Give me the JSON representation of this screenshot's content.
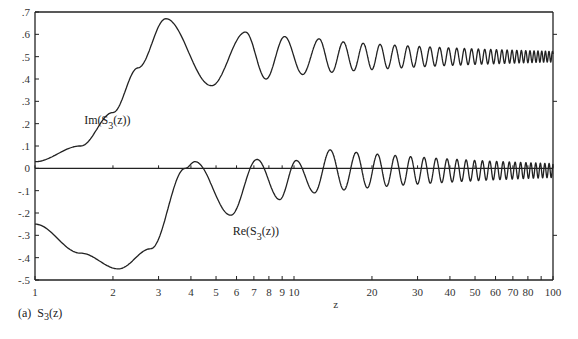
{
  "chart_data": {
    "type": "line",
    "title": "",
    "caption": {
      "prefix": "(a)",
      "func": "S",
      "sub": "3",
      "arg": "(z)"
    },
    "xlabel": "z",
    "ylabel": "",
    "xscale": "log",
    "xlim": [
      1,
      100
    ],
    "ylim": [
      -0.5,
      0.7
    ],
    "grid": false,
    "xticks": [
      1,
      2,
      3,
      4,
      5,
      6,
      7,
      8,
      9,
      10,
      20,
      30,
      40,
      50,
      60,
      70,
      80,
      100
    ],
    "xtick_labels": [
      "1",
      "2",
      "3",
      "4",
      "5",
      "6",
      "7",
      "8",
      "9",
      "10",
      "20",
      "30",
      "40",
      "50",
      "60",
      "70",
      "80",
      "100"
    ],
    "yticks": [
      0.7,
      0.6,
      0.5,
      0.4,
      0.3,
      0.2,
      0.1,
      0,
      -0.1,
      -0.2,
      -0.3,
      -0.4,
      -0.5
    ],
    "ytick_labels": [
      ".7",
      ".6",
      ".5",
      ".4",
      ".3",
      ".2",
      ".1",
      "0",
      "-.1",
      "-.2",
      "-.3",
      "-.4",
      "-.5"
    ],
    "series": [
      {
        "name": "Im(S3(z))",
        "label": {
          "pre": "Im(S",
          "sub": "3",
          "post": "(z))",
          "z": 1.55,
          "y": 0.2
        },
        "key_points": [
          [
            1,
            0.03
          ],
          [
            1.5,
            0.1
          ],
          [
            2,
            0.25
          ],
          [
            2.5,
            0.45
          ],
          [
            3.2,
            0.67
          ],
          [
            4.8,
            0.37
          ],
          [
            6.5,
            0.61
          ],
          [
            7.8,
            0.4
          ],
          [
            9.2,
            0.59
          ],
          [
            10.8,
            0.42
          ],
          [
            12.5,
            0.58
          ],
          [
            14,
            0.43
          ],
          [
            100,
            0.5
          ]
        ],
        "asymptote": 0.5
      },
      {
        "name": "Re(S3(z))",
        "label": {
          "pre": "Re(S",
          "sub": "3",
          "post": "(z))",
          "z": 5.8,
          "y": -0.3
        },
        "key_points": [
          [
            1,
            -0.25
          ],
          [
            1.5,
            -0.38
          ],
          [
            2.1,
            -0.45
          ],
          [
            2.8,
            -0.36
          ],
          [
            3.8,
            0.0
          ],
          [
            4.15,
            0.03
          ],
          [
            5.7,
            -0.21
          ],
          [
            7.2,
            0.04
          ],
          [
            8.8,
            -0.14
          ],
          [
            10.2,
            0.035
          ],
          [
            12,
            -0.11
          ],
          [
            100,
            -0.01
          ]
        ],
        "asymptote": -0.01
      }
    ]
  }
}
